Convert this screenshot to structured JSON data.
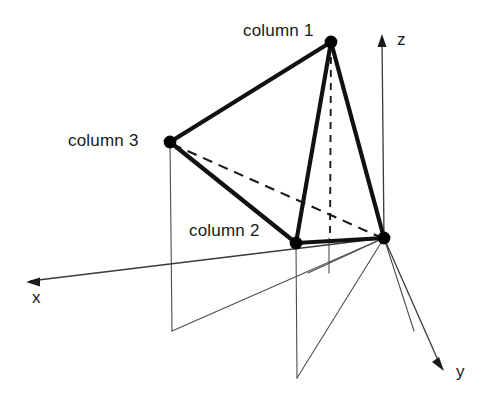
{
  "figure": {
    "background_color": "#ffffff",
    "line_color": "#1a1a1a",
    "thin_line_color": "#4d4d4d"
  },
  "axes": {
    "x": {
      "label": "x",
      "arrow_tip": [
        27,
        282
      ],
      "origin": [
        384,
        238
      ]
    },
    "y": {
      "label": "y",
      "arrow_tip": [
        443,
        370
      ],
      "origin": [
        384,
        238
      ]
    },
    "z": {
      "label": "z",
      "arrow_tip": [
        382,
        35
      ],
      "origin": [
        384,
        238
      ]
    }
  },
  "nodes": [
    {
      "id": "column1",
      "label": "column 1",
      "x": 331,
      "y": 42
    },
    {
      "id": "column2",
      "label": "column 2",
      "x": 296,
      "y": 243
    },
    {
      "id": "column3",
      "label": "column 3",
      "x": 170,
      "y": 142
    },
    {
      "id": "origin",
      "label": "",
      "x": 384,
      "y": 238
    }
  ],
  "edges": [
    {
      "from": "column1",
      "to": "column3",
      "style": "solid"
    },
    {
      "from": "column1",
      "to": "column2",
      "style": "solid"
    },
    {
      "from": "column1",
      "to": "origin",
      "style": "solid"
    },
    {
      "from": "column3",
      "to": "column2",
      "style": "solid"
    },
    {
      "from": "column2",
      "to": "origin",
      "style": "solid"
    },
    {
      "from": "column3",
      "to": "origin",
      "style": "dashed"
    }
  ],
  "hidden_edges": [
    {
      "name": "column1-vertical-drop",
      "from": [
        331,
        42
      ],
      "to": [
        330,
        241
      ],
      "style": "dashed"
    }
  ],
  "projection_lines": [
    {
      "name": "drop-column3",
      "from": [
        170,
        142
      ],
      "to": [
        172,
        331
      ]
    },
    {
      "name": "drop-column2",
      "from": [
        296,
        243
      ],
      "to": [
        297,
        378
      ]
    },
    {
      "name": "drop-column1-proj",
      "from": [
        329,
        238
      ],
      "to": [
        329,
        273
      ]
    },
    {
      "name": "ray-origin-to-column3-base",
      "from": [
        384,
        238
      ],
      "to": [
        172,
        331
      ]
    },
    {
      "name": "ray-origin-to-column2-base",
      "from": [
        384,
        238
      ],
      "to": [
        297,
        378
      ]
    },
    {
      "name": "ray-origin-to-column1-base",
      "from": [
        384,
        238
      ],
      "to": [
        308,
        274
      ]
    },
    {
      "name": "ray-origin-downright",
      "from": [
        384,
        238
      ],
      "to": [
        414,
        330
      ]
    }
  ]
}
